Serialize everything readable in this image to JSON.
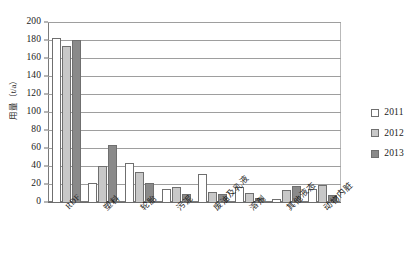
{
  "chart_data": {
    "type": "bar",
    "title": "",
    "xlabel": "",
    "ylabel": "用量（t/a）",
    "ylim": [
      0,
      200
    ],
    "ytick_step": 20,
    "yticks": [
      "200",
      "180",
      "160",
      "140",
      "120",
      "100",
      "80",
      "60",
      "40",
      "20",
      "0"
    ],
    "grid": true,
    "legend_position": "right",
    "categories": [
      "RDF",
      "塑料",
      "轮胎",
      "污泥",
      "废油及乳液",
      "溶剂",
      "其他液态",
      "动物内脏"
    ],
    "series": [
      {
        "name": "2011",
        "color": "#ffffff",
        "values": [
          182,
          21,
          43,
          14,
          31,
          17,
          3,
          14
        ]
      },
      {
        "name": "2012",
        "color": "#c8c8c8",
        "values": [
          173,
          40,
          33,
          17,
          11,
          10,
          13,
          19
        ]
      },
      {
        "name": "2013",
        "color": "#8a8a8a",
        "values": [
          180,
          63,
          21,
          9,
          9,
          5,
          18,
          8
        ]
      }
    ]
  },
  "legend": {
    "items": [
      {
        "label": "2011"
      },
      {
        "label": "2012"
      },
      {
        "label": "2013"
      }
    ]
  }
}
